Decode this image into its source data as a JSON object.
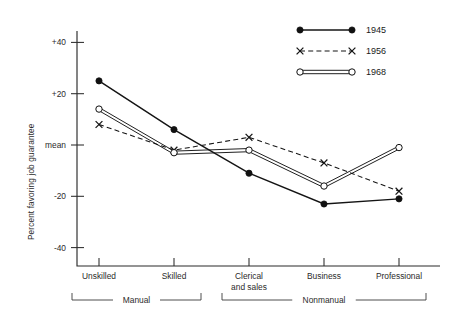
{
  "chart_data": {
    "type": "line",
    "title": "",
    "xlabel": "",
    "ylabel": "Percent favoring  job guarantee",
    "categories": [
      "Unskilled",
      "Skilled",
      "Clerical and sales",
      "Business",
      "Professional"
    ],
    "category_lines": [
      [
        "Unskilled"
      ],
      [
        "Skilled"
      ],
      [
        "Clerical",
        "and sales"
      ],
      [
        "Business"
      ],
      [
        "Professional"
      ]
    ],
    "ylim": [
      -50,
      50
    ],
    "ytick_values": [
      40,
      20,
      0,
      -20,
      -40
    ],
    "ytick_labels": [
      "+40",
      "+20",
      "mean",
      "-20",
      "-40"
    ],
    "grid": false,
    "legend_position": "top-right",
    "series": [
      {
        "name": "1945",
        "marker": "filled-circle",
        "linestyle": "solid",
        "values": [
          25,
          6,
          -11,
          -23,
          -21
        ]
      },
      {
        "name": "1956",
        "marker": "x",
        "linestyle": "dashed",
        "values": [
          8,
          -2,
          3,
          -7,
          -18
        ]
      },
      {
        "name": "1968",
        "marker": "open-circle",
        "linestyle": "double",
        "values": [
          14,
          -3,
          -2,
          -16,
          -1
        ]
      }
    ],
    "group_brackets": [
      {
        "label": "Manual",
        "from": "Unskilled",
        "to": "Skilled"
      },
      {
        "label": "Nonmanual",
        "from": "Clerical and sales",
        "to": "Professional"
      }
    ],
    "colors": {
      "series_1945": "#141414",
      "series_1956": "#141414",
      "series_1968": "#141414",
      "axis": "#2b2b2b",
      "background": "#ffffff"
    }
  },
  "legend": {
    "items": [
      {
        "label": "1945"
      },
      {
        "label": "1956"
      },
      {
        "label": "1968"
      }
    ]
  }
}
